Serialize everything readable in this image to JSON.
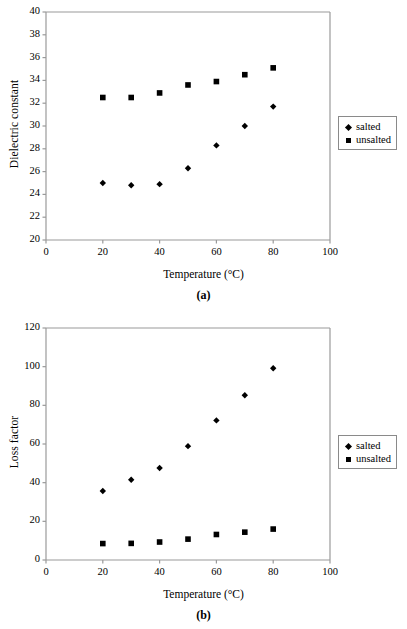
{
  "figure": {
    "panels": [
      {
        "caption": "(a)",
        "xlabel": "Temperature (°C)",
        "ylabel": "Dielectric constant",
        "legend": {
          "entries": [
            {
              "marker": "diamond-marker",
              "label": "salted"
            },
            {
              "marker": "square-marker",
              "label": "unsalted"
            }
          ]
        },
        "xticks": [
          "0",
          "20",
          "40",
          "60",
          "80",
          "100"
        ],
        "yticks": [
          "20",
          "22",
          "24",
          "26",
          "28",
          "30",
          "32",
          "34",
          "36",
          "38",
          "40"
        ]
      },
      {
        "caption": "(b)",
        "xlabel": "Temperature (°C)",
        "ylabel": "Loss factor",
        "legend": {
          "entries": [
            {
              "marker": "diamond-marker",
              "label": "salted"
            },
            {
              "marker": "square-marker",
              "label": "unsalted"
            }
          ]
        },
        "xticks": [
          "0",
          "20",
          "40",
          "60",
          "80",
          "100"
        ],
        "yticks": [
          "0",
          "20",
          "40",
          "60",
          "80",
          "100",
          "120"
        ]
      }
    ]
  },
  "chart_data": [
    {
      "type": "scatter",
      "title": "(a)",
      "xlabel": "Temperature (°C)",
      "ylabel": "Dielectric constant",
      "x": [
        20,
        30,
        40,
        50,
        60,
        70,
        80
      ],
      "xlim": [
        0,
        100
      ],
      "ylim": [
        20,
        40
      ],
      "xticks": [
        0,
        20,
        40,
        60,
        80,
        100
      ],
      "yticks": [
        20,
        22,
        24,
        26,
        28,
        30,
        32,
        34,
        36,
        38,
        40
      ],
      "grid": false,
      "legend_position": "right",
      "series": [
        {
          "name": "salted",
          "marker": "diamond",
          "color": "#000000",
          "values": [
            25.0,
            24.8,
            24.9,
            26.3,
            28.3,
            30.0,
            31.7
          ]
        },
        {
          "name": "unsalted",
          "marker": "square",
          "color": "#000000",
          "values": [
            32.5,
            32.5,
            32.9,
            33.6,
            33.9,
            34.5,
            35.1
          ]
        }
      ]
    },
    {
      "type": "scatter",
      "title": "(b)",
      "xlabel": "Temperature (°C)",
      "ylabel": "Loss factor",
      "x": [
        20,
        30,
        40,
        50,
        60,
        70,
        80
      ],
      "xlim": [
        0,
        100
      ],
      "ylim": [
        0,
        120
      ],
      "xticks": [
        0,
        20,
        40,
        60,
        80,
        100
      ],
      "yticks": [
        0,
        20,
        40,
        60,
        80,
        100,
        120
      ],
      "grid": false,
      "legend_position": "right",
      "series": [
        {
          "name": "salted",
          "marker": "diamond",
          "color": "#000000",
          "values": [
            35.7,
            41.5,
            47.6,
            58.9,
            72.2,
            85.2,
            99.2
          ]
        },
        {
          "name": "unsalted",
          "marker": "square",
          "color": "#000000",
          "values": [
            8.5,
            8.6,
            9.3,
            10.8,
            13.2,
            14.4,
            16.0
          ]
        }
      ]
    }
  ]
}
